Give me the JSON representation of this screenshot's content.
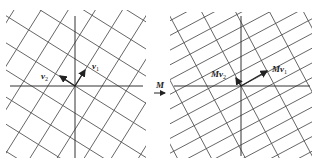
{
  "diagram": {
    "colors": {
      "grid": "#555555",
      "axis": "#333333",
      "arrow": "#222222",
      "background": "#ffffff"
    },
    "left_panel": {
      "vectors": [
        {
          "name": "v1",
          "label": "v",
          "subscript": "1"
        },
        {
          "name": "v2",
          "label": "v",
          "subscript": "2"
        }
      ]
    },
    "transform": {
      "label": "M"
    },
    "right_panel": {
      "vectors": [
        {
          "name": "Mv1",
          "label": "Mv",
          "subscript": "1"
        },
        {
          "name": "Mv2",
          "label": "Mv",
          "subscript": "2"
        }
      ]
    }
  }
}
